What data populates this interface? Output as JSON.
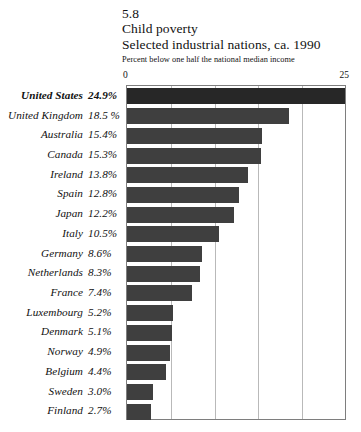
{
  "header": {
    "figure_number": "5.8",
    "title": "Child poverty",
    "subtitle": "Selected industrial nations, ca. 1990",
    "caption": "Percent below one half the national median income"
  },
  "axis": {
    "min_label": "0",
    "max_label": "25"
  },
  "colors": {
    "bar": "#3f3f3f",
    "bar_highlight": "#272727",
    "gridline": "#b9b9b9",
    "frame": "#7e7e7e",
    "background": "#ffffff",
    "text": "#111111"
  },
  "chart_data": {
    "type": "bar",
    "orientation": "horizontal",
    "title": "Child poverty",
    "subtitle": "Selected industrial nations, ca. 1990",
    "xlabel": "Percent below one half the national median income",
    "ylabel": "",
    "xlim": [
      0,
      25
    ],
    "grid": true,
    "gridline_values": [
      5,
      10,
      15,
      20
    ],
    "legend": false,
    "highlight_category": "United States",
    "categories": [
      "United States",
      "United Kingdom",
      "Australia",
      "Canada",
      "Ireland",
      "Spain",
      "Japan",
      "Italy",
      "Germany",
      "Netherlands",
      "France",
      "Luxembourg",
      "Denmark",
      "Norway",
      "Belgium",
      "Sweden",
      "Finland"
    ],
    "values": [
      24.9,
      18.5,
      15.4,
      15.3,
      13.8,
      12.8,
      12.2,
      10.5,
      8.6,
      8.3,
      7.4,
      5.2,
      5.1,
      4.9,
      4.4,
      3.0,
      2.7
    ],
    "value_labels": [
      "24.9%",
      "18.5 %",
      "15.4%",
      "15.3%",
      "13.8%",
      "12.8%",
      "12.2%",
      "10.5%",
      "8.6%",
      "8.3%",
      "7.4%",
      "5.2%",
      "5.1%",
      "4.9%",
      "4.4%",
      "3.0%",
      "2.7%"
    ]
  }
}
